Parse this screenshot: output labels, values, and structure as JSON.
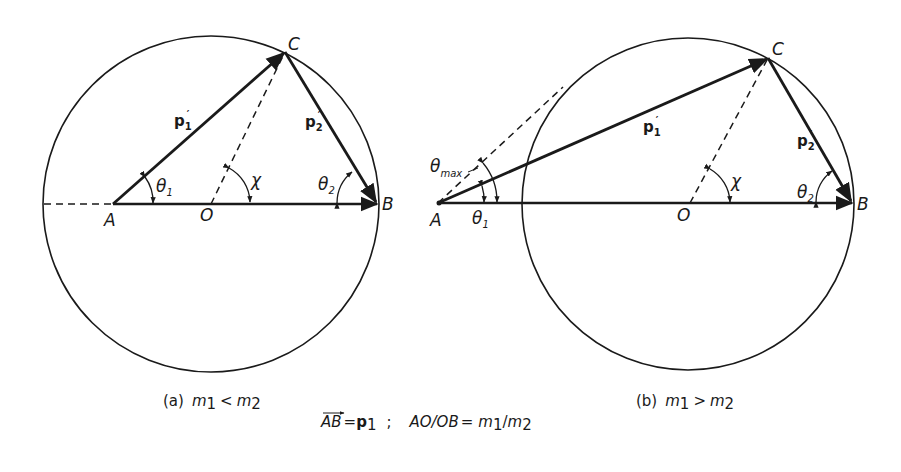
{
  "figure": {
    "panel_a": {
      "points": {
        "A": "A",
        "O": "O",
        "B": "B",
        "C": "C"
      },
      "vectors": {
        "p1_prime": "p",
        "p1_sub": "1",
        "p2_prime": "p",
        "p2_sub": "2",
        "prime": "′"
      },
      "angles": {
        "theta1": "θ",
        "theta1_sub": "1",
        "theta2": "θ",
        "theta2_sub": "2",
        "chi": "χ"
      },
      "caption": {
        "prefix": "(a)",
        "m1": "m",
        "m1_sub": "1",
        "rel": "<",
        "m2": "m",
        "m2_sub": "2"
      }
    },
    "panel_b": {
      "points": {
        "A": "A",
        "O": "O",
        "B": "B",
        "C": "C"
      },
      "vectors": {
        "p1_prime": "p",
        "p1_sub": "1",
        "p2_prime": "p",
        "p2_sub": "2",
        "prime": "′"
      },
      "angles": {
        "theta1": "θ",
        "theta1_sub": "1",
        "theta2": "θ",
        "theta2_sub": "2",
        "chi": "χ",
        "theta_max": "θ",
        "theta_max_sub": "max"
      },
      "caption": {
        "prefix": "(b)",
        "m1": "m",
        "m1_sub": "1",
        "rel": ">",
        "m2": "m",
        "m2_sub": "2"
      }
    },
    "footer": {
      "ab": "AB",
      "eq1": "=",
      "p": "p",
      "p_sub": "1",
      "sep": ";",
      "ratio_lhs": "AO/OB",
      "eq2": "=",
      "m1": "m",
      "m1_sub": "1",
      "slash": "/",
      "m2": "m",
      "m2_sub": "2"
    },
    "colors": {
      "ink": "#1a1a1a",
      "background": "#ffffff"
    }
  }
}
